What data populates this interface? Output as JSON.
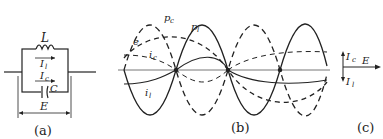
{
  "figure": {
    "panel_a": {
      "caption": "(a)",
      "inductor_label": "L",
      "inductor_current_label": "I",
      "inductor_current_sub": "l",
      "capacitor_current_label": "I",
      "capacitor_current_sub": "c",
      "capacitor_label": "C",
      "voltage_label": "E"
    },
    "panel_b": {
      "caption": "(b)",
      "curve_labels": {
        "pc": "p",
        "pc_sub": "c",
        "pl": "p",
        "pl_sub": "l",
        "e": "e",
        "ic": "i",
        "ic_sub": "c",
        "il": "i",
        "il_sub": "l"
      }
    },
    "panel_c": {
      "caption": "(c)",
      "phasor_ic": "I",
      "phasor_ic_sub": "c",
      "phasor_e": "E",
      "phasor_il": "I",
      "phasor_il_sub": "l"
    },
    "colors": {
      "ink": "#222222",
      "axis": "#555555",
      "background": "#ffffff"
    }
  }
}
